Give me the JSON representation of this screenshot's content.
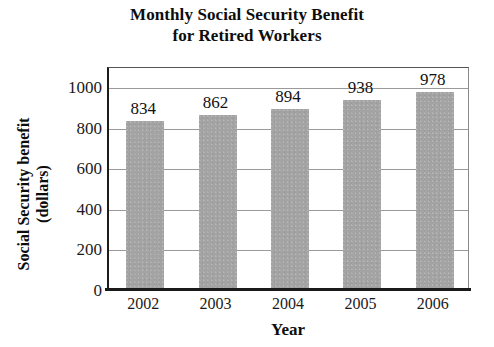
{
  "chart_data": {
    "type": "bar",
    "title": "Monthly Social Security Benefit for Retired Workers",
    "title_lines": [
      "Monthly Social Security Benefit",
      "for Retired Workers"
    ],
    "xlabel": "Year",
    "ylabel": "Social Security benefit (dollars)",
    "ylabel_lines": [
      "Social Security benefit",
      "(dollars)"
    ],
    "categories": [
      "2002",
      "2003",
      "2004",
      "2005",
      "2006"
    ],
    "values": [
      834,
      862,
      894,
      938,
      978
    ],
    "data_labels": [
      "834",
      "862",
      "894",
      "938",
      "978"
    ],
    "ylim": [
      0,
      1100
    ],
    "y_ticks": [
      1000,
      800,
      600,
      400,
      200,
      0
    ],
    "y_tick_labels": [
      "1000",
      "800",
      "600",
      "400",
      "200",
      "0"
    ],
    "grid": true,
    "grid_axis": "y",
    "legend": false,
    "bar_color": "#a3a3a3",
    "axis_color": "#1a1a1a",
    "grid_color": "#9a9a9a",
    "background_color": "#ffffff"
  }
}
